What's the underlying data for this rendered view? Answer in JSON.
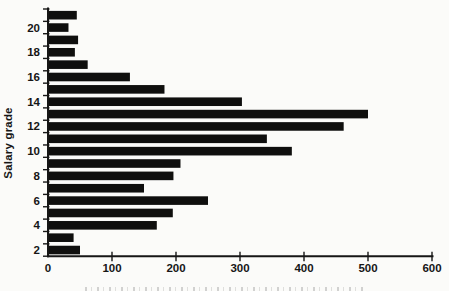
{
  "chart_data": {
    "type": "bar",
    "orientation": "horizontal",
    "title": "",
    "xlabel": "",
    "ylabel": "Salary grade",
    "xlim": [
      0,
      600
    ],
    "x_ticks": [
      0,
      100,
      200,
      300,
      400,
      500,
      600
    ],
    "categories_top_to_bottom": [
      21,
      20,
      19,
      18,
      17,
      16,
      15,
      14,
      13,
      12,
      11,
      10,
      9,
      8,
      7,
      6,
      5,
      4,
      3,
      2
    ],
    "values_top_to_bottom": [
      45,
      32,
      47,
      42,
      62,
      128,
      182,
      303,
      500,
      462,
      342,
      381,
      207,
      196,
      150,
      250,
      195,
      170,
      40,
      50
    ],
    "y_tick_labels_shown": [
      "20",
      "18",
      "16",
      "14",
      "12",
      "10",
      "8",
      "6",
      "4",
      "2"
    ],
    "grid": false,
    "legend": false,
    "bar_color": "#0f0f0e",
    "axis_color": "#161616",
    "text_color": "#161616",
    "background_color": "#fbfbf9"
  }
}
